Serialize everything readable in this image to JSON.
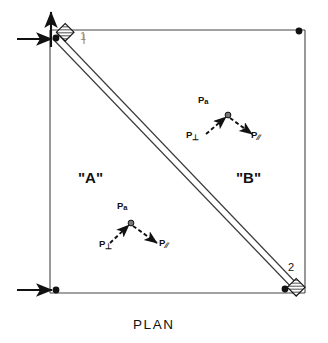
{
  "figure": {
    "caption": "PLAN",
    "type": "structural-plan-diagram"
  },
  "colors": {
    "ink": "#111111",
    "line": "#333333",
    "background": "#ffffff"
  },
  "regions": [
    {
      "id": "A",
      "label": "\"A\"",
      "x": 85,
      "y": 178
    },
    {
      "id": "B",
      "label": "\"B\"",
      "x": 243,
      "y": 178
    }
  ],
  "nodes": [
    {
      "id": "1",
      "label": "1",
      "x": 83,
      "y": 38,
      "marker": "hatched-support"
    },
    {
      "id": "2",
      "label": "2",
      "x": 291,
      "y": 268,
      "marker": "hatched-support"
    }
  ],
  "force_diagrams": [
    {
      "id": "upper",
      "origin_x": 228,
      "origin_y": 115,
      "vectors": [
        {
          "name": "P-alpha",
          "label": "P",
          "subscript": "a",
          "label_x": 200,
          "label_y": 99
        },
        {
          "name": "P-perpendicular",
          "label": "P",
          "subscript": "⊥",
          "label_x": 189,
          "label_y": 134
        },
        {
          "name": "P-parallel",
          "label": "P",
          "subscript": "∕∕",
          "label_x": 253,
          "label_y": 134
        }
      ]
    },
    {
      "id": "lower",
      "origin_x": 131,
      "origin_y": 223,
      "vectors": [
        {
          "name": "P-alpha",
          "label": "P",
          "subscript": "a",
          "label_x": 119,
          "label_y": 205
        },
        {
          "name": "P-perpendicular",
          "label": "P",
          "subscript": "⊥",
          "label_x": 101,
          "label_y": 243
        },
        {
          "name": "P-parallel",
          "label": "P",
          "subscript": "∕∕",
          "label_x": 162,
          "label_y": 242
        }
      ]
    }
  ],
  "supports": {
    "top_left": {
      "reactions": [
        "vertical-up-arrow",
        "horizontal-right-arrow"
      ]
    },
    "bottom_left": {
      "reactions": [
        "horizontal-right-arrow"
      ]
    }
  },
  "geometry": {
    "frame_left": 50,
    "frame_top": 30,
    "frame_right": 305,
    "frame_bottom": 293,
    "diagonal_from": [
      57,
      36
    ],
    "diagonal_to": [
      298,
      287
    ]
  }
}
